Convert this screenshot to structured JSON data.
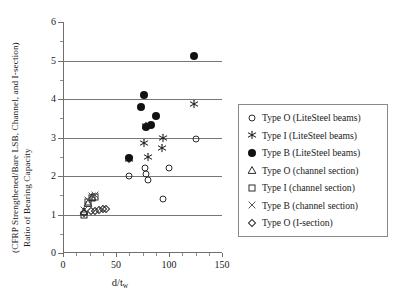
{
  "chart_data": {
    "type": "scatter",
    "title": "",
    "xlabel": "d/tw",
    "xlabel_base": "d/t",
    "xlabel_sub": "w",
    "ylabel_line1": "Ratio of Bearing Capacity",
    "ylabel_line2": "(CFRP Strengthened/Bare  LSB, Channel, and I-section)",
    "xlim": [
      0,
      150
    ],
    "ylim": [
      0,
      6
    ],
    "xticks": [
      0,
      50,
      100,
      150
    ],
    "xtick_labels": [
      "0",
      "50",
      "100",
      "150"
    ],
    "xticks_minor": [
      12.5,
      25,
      37.5,
      62.5,
      75,
      87.5,
      112.5,
      125,
      137.5
    ],
    "yticks": [
      0,
      1,
      2,
      3,
      4,
      5,
      6
    ],
    "ytick_labels": [
      "0",
      "1",
      "2",
      "3",
      "4",
      "5",
      "6"
    ],
    "yticks_minor": [
      0.5,
      1.5,
      2.5,
      3.5,
      4.5,
      5.5
    ],
    "gridlines_y": [
      1,
      2,
      3,
      4,
      5
    ],
    "grid": "horizontal",
    "legend_position": "right-outside",
    "series": [
      {
        "name": "Type O (LiteSteel beams)",
        "marker": "open-circle",
        "points": [
          [
            62,
            2.0
          ],
          [
            77,
            2.2
          ],
          [
            78,
            2.05
          ],
          [
            80,
            1.9
          ],
          [
            94,
            1.4
          ],
          [
            100,
            2.2
          ],
          [
            125,
            2.95
          ]
        ]
      },
      {
        "name": "Type I (LiteSteel beams)",
        "marker": "asterisk",
        "points": [
          [
            62,
            2.45
          ],
          [
            76,
            2.85
          ],
          [
            78,
            3.3
          ],
          [
            80,
            2.5
          ],
          [
            93,
            2.72
          ],
          [
            94,
            3.0
          ],
          [
            124,
            3.87
          ]
        ]
      },
      {
        "name": "Type B (LiteSteel beams)",
        "marker": "filled-circle",
        "points": [
          [
            62,
            2.48
          ],
          [
            74,
            3.8
          ],
          [
            76,
            4.1
          ],
          [
            78,
            3.27
          ],
          [
            83,
            3.32
          ],
          [
            88,
            3.55
          ],
          [
            124,
            5.12
          ]
        ]
      },
      {
        "name": "Type O (channel section)",
        "marker": "open-triangle",
        "points": [
          [
            20,
            1.08
          ],
          [
            24,
            1.3
          ],
          [
            27,
            1.45
          ]
        ]
      },
      {
        "name": "Type I (channel section)",
        "marker": "open-square",
        "points": [
          [
            20,
            1.0
          ],
          [
            24,
            1.33
          ],
          [
            27,
            1.43
          ],
          [
            30,
            1.45
          ]
        ]
      },
      {
        "name": "Type B (channel section)",
        "marker": "cross",
        "points": [
          [
            20,
            1.12
          ],
          [
            24,
            1.38
          ],
          [
            27,
            1.48
          ],
          [
            30,
            1.5
          ]
        ]
      },
      {
        "name": "Type O (I-section)",
        "marker": "open-diamond",
        "points": [
          [
            20,
            1.05
          ],
          [
            26,
            1.08
          ],
          [
            30,
            1.1
          ],
          [
            34,
            1.12
          ],
          [
            38,
            1.15
          ],
          [
            41,
            1.15
          ]
        ]
      }
    ]
  },
  "legend": {
    "items": [
      {
        "label": "Type O (LiteSteel beams)",
        "marker": "open-circle"
      },
      {
        "label": "Type I (LiteSteel beams)",
        "marker": "asterisk"
      },
      {
        "label": "Type B (LiteSteel beams)",
        "marker": "filled-circle"
      },
      {
        "label": "Type O (channel section)",
        "marker": "open-triangle"
      },
      {
        "label": "Type I (channel section)",
        "marker": "open-square"
      },
      {
        "label": "Type B (channel section)",
        "marker": "cross"
      },
      {
        "label": "Type O (I-section)",
        "marker": "open-diamond"
      }
    ]
  },
  "colors": {
    "marker_dark": "#111111",
    "marker_outline": "#2b2b2b",
    "gridline": "#767676",
    "axis": "#6e6e6e",
    "text": "#1a1a1a",
    "background": "#ffffff"
  }
}
